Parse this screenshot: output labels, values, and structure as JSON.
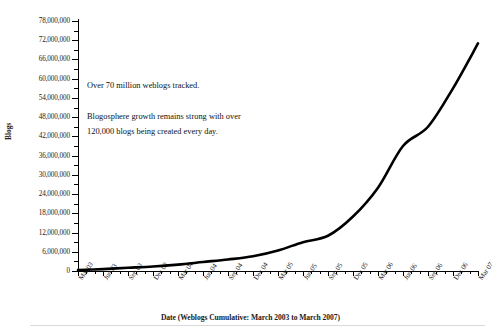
{
  "chart_data": {
    "type": "line",
    "title": "",
    "xlabel": "Date (Weblogs Cumulative: March 2003 to March 2007)",
    "ylabel": "Blogs",
    "categories": [
      "Mar 03",
      "Jun 03",
      "Sep 03",
      "Dec 03",
      "Mar 04",
      "Jun 04",
      "Sep 04",
      "Dec 04",
      "Mar 05",
      "Jun 05",
      "Sep 05",
      "Dec 05",
      "Mar 06",
      "Jun 06",
      "Sep 06",
      "Dec 06",
      "Mar 07"
    ],
    "values": [
      300000,
      600000,
      1000000,
      1400000,
      2000000,
      2800000,
      3600000,
      4600000,
      6400000,
      9000000,
      11000000,
      17000000,
      26000000,
      39000000,
      45000000,
      57000000,
      71000000
    ],
    "ylim": [
      0,
      78000000
    ],
    "ytick_labels": [
      "78,000,000",
      "72,000,000",
      "66,000,000",
      "60,000,000",
      "54,000,000",
      "48,000,000",
      "42,000,000",
      "36,000,000",
      "30,000,000",
      "24,000,000",
      "18,000,000",
      "12,000,000",
      "6,000,000",
      "0"
    ],
    "ytick_values": [
      78000000,
      72000000,
      66000000,
      60000000,
      54000000,
      48000000,
      42000000,
      36000000,
      30000000,
      24000000,
      18000000,
      12000000,
      6000000,
      0
    ],
    "ytick_step": 6000000,
    "grid": false,
    "legend": null,
    "line_color": "#000000",
    "line_width": 2.6,
    "annotations": [
      "Over 70 million weblogs tracked.",
      "Blogosphere growth remains strong with over 120,000 blogs being created every day."
    ]
  },
  "axis": {
    "y_title": "Blogs",
    "x_title": "Date (Weblogs Cumulative: March 2003 to March 2007)"
  },
  "annotation": {
    "line1": "Over 70 million weblogs tracked.",
    "line2": "Blogosphere growth remains strong with over",
    "line3": "120,000 blogs being created every day."
  }
}
